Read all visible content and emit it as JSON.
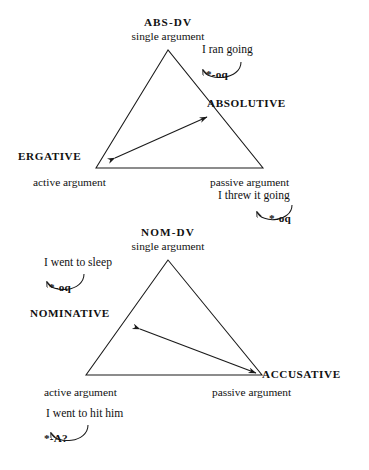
{
  "figure": {
    "type": "linguistic-alignment-triangles"
  },
  "upper": {
    "dv_label": "ABS-DV",
    "dv_sub": "single argument",
    "ergative_label": "ERGATIVE",
    "ergative_sub": "active argument",
    "absolutive_label": "ABSOLUTIVE",
    "absolutive_sub": "passive argument",
    "gloss_top": "I ran going",
    "morph_top": "*-oq",
    "gloss_bottom": "I threw it going",
    "morph_bottom": "*-oq"
  },
  "lower": {
    "dv_label": "NOM-DV",
    "dv_sub": "single argument",
    "nominative_label": "NOMINATIVE",
    "nominative_sub": "active argument",
    "accusative_label": "ACCUSATIVE",
    "accusative_sub": "passive argument",
    "gloss_top": "I went to sleep",
    "morph_top": "*-oq",
    "gloss_bottom": "I went to hit him",
    "morph_bottom": "*-A?"
  },
  "style": {
    "stroke": "#1a1a1a",
    "background": "#ffffff"
  }
}
